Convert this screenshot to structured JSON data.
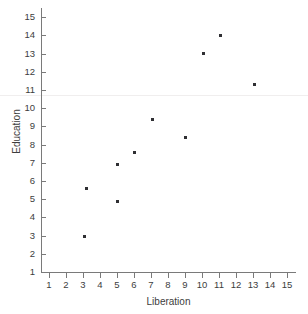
{
  "chart_data": {
    "type": "scatter",
    "title": "",
    "xlabel": "Liberation",
    "ylabel": "Education",
    "xlim": [
      0.5,
      15.5
    ],
    "ylim": [
      1,
      15
    ],
    "xticks": [
      1,
      2,
      3,
      4,
      5,
      6,
      7,
      8,
      9,
      10,
      11,
      12,
      13,
      14,
      15
    ],
    "yticks": [
      1,
      2,
      3,
      4,
      5,
      6,
      7,
      8,
      9,
      10,
      11,
      12,
      13,
      14,
      15
    ],
    "xtick_labels": [
      "1",
      "2",
      "3",
      "4",
      "5",
      "6",
      "7",
      "8",
      "9",
      "10",
      "11",
      "12",
      "13",
      "14",
      "15"
    ],
    "ytick_labels": [
      "1",
      "2",
      "3",
      "4",
      "5",
      "6",
      "7",
      "8",
      "9",
      "10",
      "11",
      "12",
      "13",
      "14",
      "15"
    ],
    "grid": false,
    "legend": null,
    "marker_color": "#2f2f33",
    "axis_color": "#7a7a7a",
    "reference_line_y": 10.75,
    "points": [
      {
        "x": 3.1,
        "y": 2.95
      },
      {
        "x": 3.2,
        "y": 5.6
      },
      {
        "x": 5.05,
        "y": 4.9
      },
      {
        "x": 5.05,
        "y": 6.9
      },
      {
        "x": 6.05,
        "y": 7.55
      },
      {
        "x": 7.1,
        "y": 9.4
      },
      {
        "x": 9.05,
        "y": 8.4
      },
      {
        "x": 10.1,
        "y": 13.0
      },
      {
        "x": 11.1,
        "y": 14.0
      },
      {
        "x": 13.1,
        "y": 11.3
      }
    ]
  },
  "labels": {
    "x_axis_title": "Liberation",
    "y_axis_title": "Education"
  }
}
